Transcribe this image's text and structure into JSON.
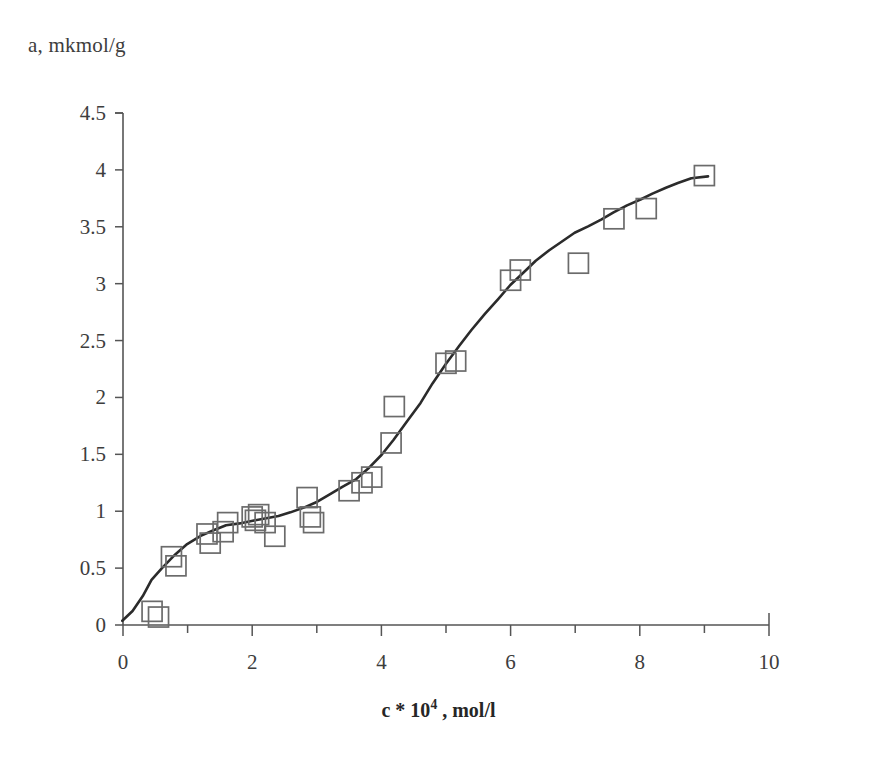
{
  "figure": {
    "background_color": "#ffffff",
    "axis_color": "#555555",
    "curve_color": "#2b2b2b",
    "marker_edge_color": "#6b6b6b"
  },
  "axes": {
    "ylabel_text": "a, mkmol/g",
    "xlabel_prefix": "c * 10",
    "xlabel_exponent": "4",
    "xlabel_suffix": " , mol/l"
  },
  "chart_data": {
    "type": "scatter",
    "title": "",
    "subtitle": "",
    "xlabel": "c * 10^4 , mol/l",
    "ylabel": "a, mkmol/g",
    "xlim": [
      0,
      10
    ],
    "ylim": [
      0,
      4.5
    ],
    "xticks": [
      0,
      1,
      2,
      3,
      4,
      5,
      6,
      7,
      8,
      9,
      10
    ],
    "xtick_labels": [
      "0",
      "",
      "2",
      "",
      "4",
      "",
      "6",
      "",
      "8",
      "",
      "10"
    ],
    "yticks": [
      0,
      0.5,
      1,
      1.5,
      2,
      2.5,
      3,
      3.5,
      4,
      4.5
    ],
    "ytick_labels": [
      "0",
      "0.5",
      "1",
      "1.5",
      "2",
      "2.5",
      "3",
      "3.5",
      "4",
      "4.5"
    ],
    "grid": false,
    "legend": null,
    "legend_position": "none",
    "marker_style": "open-square",
    "series": [
      {
        "name": "measured adsorption",
        "type": "scatter",
        "x": [
          0.45,
          0.55,
          0.75,
          0.82,
          1.3,
          1.35,
          1.55,
          1.62,
          2.0,
          2.05,
          2.1,
          2.2,
          2.35,
          2.85,
          2.9,
          2.95,
          3.5,
          3.7,
          3.85,
          4.15,
          4.2,
          5.0,
          5.15,
          6.0,
          6.15,
          7.05,
          7.6,
          8.1,
          9.0
        ],
        "y": [
          0.12,
          0.07,
          0.6,
          0.52,
          0.8,
          0.72,
          0.82,
          0.9,
          0.95,
          0.92,
          0.97,
          0.9,
          0.78,
          1.12,
          0.95,
          0.9,
          1.18,
          1.25,
          1.3,
          1.6,
          1.92,
          2.3,
          2.32,
          3.03,
          3.12,
          3.18,
          3.57,
          3.66,
          3.95
        ]
      },
      {
        "name": "fitted isotherm",
        "type": "line",
        "x": [
          0.0,
          0.15,
          0.3,
          0.45,
          0.6,
          0.8,
          1.0,
          1.2,
          1.4,
          1.6,
          1.8,
          2.0,
          2.2,
          2.4,
          2.6,
          2.8,
          3.0,
          3.2,
          3.4,
          3.6,
          3.8,
          4.0,
          4.2,
          4.4,
          4.6,
          4.8,
          5.0,
          5.2,
          5.4,
          5.6,
          5.8,
          6.0,
          6.2,
          6.4,
          6.6,
          6.8,
          7.0,
          7.2,
          7.4,
          7.6,
          7.8,
          8.0,
          8.2,
          8.4,
          8.6,
          8.8,
          9.05
        ],
        "y": [
          0.03,
          0.13,
          0.26,
          0.4,
          0.5,
          0.62,
          0.71,
          0.78,
          0.83,
          0.87,
          0.9,
          0.92,
          0.94,
          0.96,
          0.99,
          1.03,
          1.08,
          1.14,
          1.21,
          1.29,
          1.38,
          1.5,
          1.63,
          1.79,
          1.95,
          2.12,
          2.29,
          2.45,
          2.6,
          2.74,
          2.87,
          2.99,
          3.1,
          3.2,
          3.29,
          3.37,
          3.44,
          3.51,
          3.57,
          3.63,
          3.69,
          3.74,
          3.79,
          3.84,
          3.88,
          3.92,
          3.95
        ]
      }
    ]
  }
}
